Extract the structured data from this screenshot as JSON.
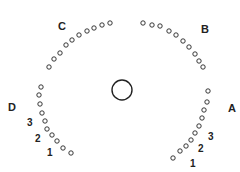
{
  "diagram": {
    "center_circle": {
      "cx": 122,
      "cy": 90,
      "r": 10
    },
    "arcs": [
      {
        "label": "C",
        "label_pos": [
          58,
          30
        ],
        "dots": [
          [
            49,
            67
          ],
          [
            54,
            59
          ],
          [
            60,
            53
          ],
          [
            66,
            45
          ],
          [
            72,
            40
          ],
          [
            79,
            35
          ],
          [
            87,
            31
          ],
          [
            94,
            28
          ],
          [
            102,
            25
          ],
          [
            110,
            23
          ]
        ]
      },
      {
        "label": "B",
        "label_pos": [
          201,
          33
        ],
        "dots": [
          [
            143,
            23
          ],
          [
            152,
            25
          ],
          [
            160,
            26
          ],
          [
            169,
            31
          ],
          [
            176,
            35
          ],
          [
            183,
            41
          ],
          [
            189,
            47
          ],
          [
            195,
            54
          ],
          [
            199,
            61
          ],
          [
            203,
            67
          ]
        ]
      },
      {
        "label": "D",
        "label_pos": [
          8,
          111
        ],
        "dots": [
          [
            41,
            87
          ],
          [
            39,
            95
          ],
          [
            40,
            104
          ],
          [
            42,
            113
          ],
          [
            45,
            121
          ],
          [
            47,
            129
          ],
          [
            52,
            135
          ],
          [
            57,
            141
          ],
          [
            63,
            148
          ],
          [
            71,
            153
          ]
        ]
      },
      {
        "label": "A",
        "label_pos": [
          228,
          112
        ],
        "dots": [
          [
            208,
            91
          ],
          [
            207,
            102
          ],
          [
            204,
            110
          ],
          [
            202,
            118
          ],
          [
            199,
            126
          ],
          [
            195,
            133
          ],
          [
            191,
            140
          ],
          [
            186,
            146
          ],
          [
            180,
            151
          ],
          [
            173,
            158
          ]
        ]
      }
    ],
    "numbers": [
      {
        "text": "3",
        "pos": [
          27,
          126
        ]
      },
      {
        "text": "2",
        "pos": [
          35,
          142
        ]
      },
      {
        "text": "1",
        "pos": [
          47,
          156
        ]
      },
      {
        "text": "3",
        "pos": [
          208,
          140
        ]
      },
      {
        "text": "2",
        "pos": [
          198,
          152
        ]
      },
      {
        "text": "1",
        "pos": [
          190,
          167
        ]
      }
    ],
    "dot_radius": 2.2,
    "stroke_color": "#222222"
  }
}
